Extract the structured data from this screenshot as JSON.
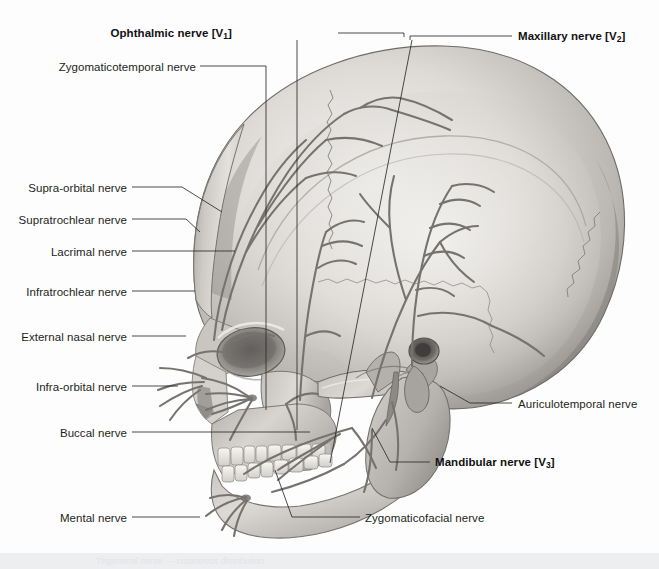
{
  "figure": {
    "view": "left lateral view of the human skull",
    "background_color": "#fdfdfd",
    "ink_color": "#231f20",
    "bone_light": "#e9e7e4",
    "bone_mid": "#bdbab6",
    "bone_dark": "#8d8a86",
    "nerve_color": "#6f6d6b",
    "leader_color": "#2a2a2a"
  },
  "caption": {
    "bar_color": "#eceef0",
    "text": "Trigeminal nerve — cutaneous distribution"
  },
  "labels_left": [
    {
      "id": "ophthalmic-nerve",
      "text": "Ophthalmic nerve [V",
      "sub": "1",
      "suffix": "]",
      "bold": true,
      "x": 232,
      "y": 27
    },
    {
      "id": "zygomaticotemporal-nerve",
      "text": "Zygomaticotemporal nerve",
      "sub": "",
      "suffix": "",
      "bold": false,
      "x": 196,
      "y": 61
    },
    {
      "id": "supra-orbital-nerve",
      "text": "Supra-orbital nerve",
      "sub": "",
      "suffix": "",
      "bold": false,
      "x": 127,
      "y": 182
    },
    {
      "id": "supratrochlear-nerve",
      "text": "Supratrochlear nerve",
      "sub": "",
      "suffix": "",
      "bold": false,
      "x": 127,
      "y": 214
    },
    {
      "id": "lacrimal-nerve",
      "text": "Lacrimal nerve",
      "sub": "",
      "suffix": "",
      "bold": false,
      "x": 127,
      "y": 246
    },
    {
      "id": "infratrochlear-nerve",
      "text": "Infratrochlear nerve",
      "sub": "",
      "suffix": "",
      "bold": false,
      "x": 127,
      "y": 286
    },
    {
      "id": "external-nasal-nerve",
      "text": "External nasal nerve",
      "sub": "",
      "suffix": "",
      "bold": false,
      "x": 127,
      "y": 331
    },
    {
      "id": "infra-orbital-nerve",
      "text": "Infra-orbital nerve",
      "sub": "",
      "suffix": "",
      "bold": false,
      "x": 127,
      "y": 381
    },
    {
      "id": "buccal-nerve",
      "text": "Buccal nerve",
      "sub": "",
      "suffix": "",
      "bold": false,
      "x": 127,
      "y": 427
    },
    {
      "id": "mental-nerve",
      "text": "Mental nerve",
      "sub": "",
      "suffix": "",
      "bold": false,
      "x": 127,
      "y": 512
    }
  ],
  "labels_right": [
    {
      "id": "maxillary-nerve",
      "text": "Maxillary nerve [V",
      "sub": "2",
      "suffix": "]",
      "bold": true,
      "x": 518,
      "y": 30
    },
    {
      "id": "auriculotemporal-nerve",
      "text": "Auriculotemporal nerve",
      "sub": "",
      "suffix": "",
      "bold": false,
      "x": 518,
      "y": 398
    },
    {
      "id": "mandibular-nerve",
      "text": "Mandibular nerve [V",
      "sub": "3",
      "suffix": "]",
      "bold": true,
      "x": 435,
      "y": 456
    },
    {
      "id": "zygomaticofacial-nerve",
      "text": "Zygomaticofacial nerve",
      "sub": "",
      "suffix": "",
      "bold": false,
      "x": 365,
      "y": 512
    }
  ],
  "leaders": [
    {
      "id": "leader-ophthalmic",
      "d": "M 338 33 L 404 33 L 404 37"
    },
    {
      "id": "leader-ophthalmic-drop",
      "d": "M 297 40 L 297 430"
    },
    {
      "id": "leader-zygomaticotemporal",
      "d": "M 200 66 L 266 66 L 266 410"
    },
    {
      "id": "leader-supraorbital",
      "d": "M 132 187 L 182 187 L 222 212"
    },
    {
      "id": "leader-supratrochlear",
      "d": "M 132 219 L 186 219 L 200 232"
    },
    {
      "id": "leader-lacrimal",
      "d": "M 132 251 L 235 251"
    },
    {
      "id": "leader-infratrochlear",
      "d": "M 132 291 L 195 291"
    },
    {
      "id": "leader-externalnasal",
      "d": "M 132 336 L 186 336"
    },
    {
      "id": "leader-infraorbital",
      "d": "M 132 386 L 178 386"
    },
    {
      "id": "leader-buccal",
      "d": "M 132 432 L 310 432"
    },
    {
      "id": "leader-mental",
      "d": "M 132 517 L 200 517"
    },
    {
      "id": "leader-maxillary",
      "d": "M 512 36 L 410 36 L 410 40"
    },
    {
      "id": "leader-maxillary-drop",
      "d": "M 412 40 L 330 463"
    },
    {
      "id": "leader-auriculotemporal",
      "d": "M 512 403 L 470 403 L 440 386"
    },
    {
      "id": "leader-mandibular",
      "d": "M 430 462 L 390 462 L 372 428"
    },
    {
      "id": "leader-zygomaticofacial",
      "d": "M 360 517 L 292 517 L 275 470"
    }
  ]
}
